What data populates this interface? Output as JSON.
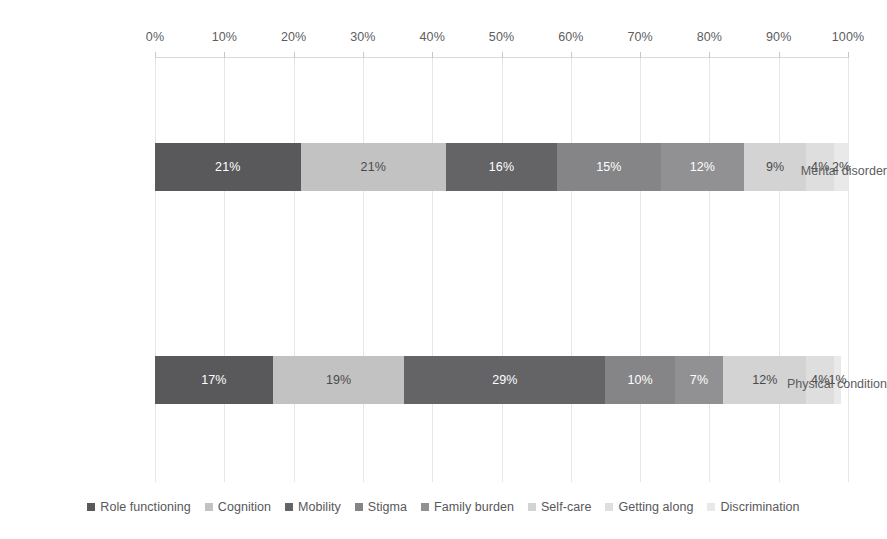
{
  "chart_data": {
    "type": "bar",
    "orientation": "horizontal",
    "stacked": true,
    "normalized_percent": true,
    "title": "",
    "subtitle": "",
    "xlabel": "",
    "ylabel": "",
    "xlim": [
      0,
      100
    ],
    "grid": true,
    "legend_position": "bottom",
    "axis_position": "top",
    "categories": [
      "Mental disorder",
      "Physical condition"
    ],
    "tick_labels": [
      "0%",
      "10%",
      "20%",
      "30%",
      "40%",
      "50%",
      "60%",
      "70%",
      "80%",
      "90%",
      "100%"
    ],
    "tick_values": [
      0,
      10,
      20,
      30,
      40,
      50,
      60,
      70,
      80,
      90,
      100
    ],
    "series": [
      {
        "name": "Role functioning",
        "color": "#59595b",
        "label_color": "#ffffff",
        "values": [
          21,
          17
        ],
        "labels": [
          "21%",
          "17%"
        ]
      },
      {
        "name": "Cognition",
        "color": "#c2c2c2",
        "label_color": "#4a4a4c",
        "values": [
          21,
          19
        ],
        "labels": [
          "21%",
          "19%"
        ]
      },
      {
        "name": "Mobility",
        "color": "#646466",
        "label_color": "#ffffff",
        "values": [
          16,
          29
        ],
        "labels": [
          "16%",
          "29%"
        ]
      },
      {
        "name": "Stigma",
        "color": "#858587",
        "label_color": "#ffffff",
        "values": [
          15,
          10
        ],
        "labels": [
          "15%",
          "10%"
        ]
      },
      {
        "name": "Family burden",
        "color": "#919193",
        "label_color": "#ffffff",
        "values": [
          12,
          7
        ],
        "labels": [
          "12%",
          "7%"
        ]
      },
      {
        "name": "Self-care",
        "color": "#d3d3d3",
        "label_color": "#4a4a4c",
        "values": [
          9,
          12
        ],
        "labels": [
          "9%",
          "12%"
        ]
      },
      {
        "name": "Getting along",
        "color": "#dedede",
        "label_color": "#4a4a4c",
        "values": [
          4,
          4
        ],
        "labels": [
          "4%",
          "4%"
        ]
      },
      {
        "name": "Discrimination",
        "color": "#e9e9e9",
        "label_color": "#4a4a4c",
        "values": [
          2,
          1
        ],
        "labels": [
          "2%",
          "1%"
        ]
      }
    ]
  }
}
